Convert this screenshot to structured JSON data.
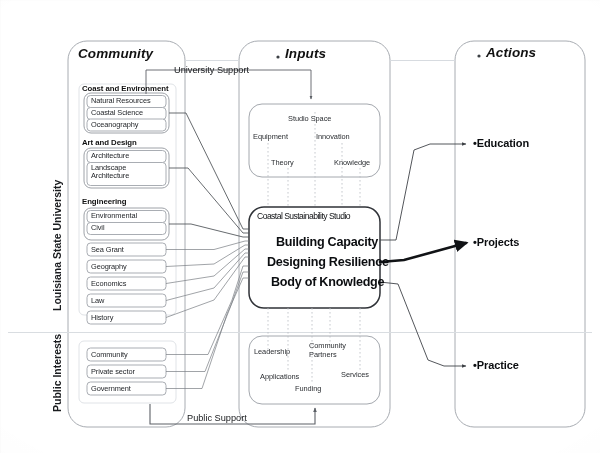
{
  "figure": {
    "columns": [
      {
        "id": "community",
        "label": "Community"
      },
      {
        "id": "inputs",
        "label": "Inputs"
      },
      {
        "id": "actions",
        "label": "Actions"
      }
    ],
    "side_labels": [
      {
        "id": "lsu",
        "label": "Louisiana State University"
      },
      {
        "id": "public",
        "label": "Public Interests"
      }
    ],
    "support_links": [
      {
        "id": "university-support",
        "label": "University Support"
      },
      {
        "id": "public-support",
        "label": "Public Support"
      }
    ]
  },
  "community": {
    "groups": [
      {
        "name": "Coast and Environment",
        "items": [
          "Natural Resources",
          "Coastal Science",
          "Oceanography"
        ]
      },
      {
        "name": "Art and Design",
        "items": [
          "Architecture",
          "Landscape Architecture"
        ]
      },
      {
        "name": "Engineering",
        "items": [
          "Environmental",
          "Civil"
        ]
      }
    ],
    "standalone": [
      "Sea Grant",
      "Geography",
      "Economics",
      "Law",
      "History"
    ],
    "public_interests": [
      "Community",
      "Private sector",
      "Government"
    ]
  },
  "inputs": {
    "upper_cluster": [
      "Studio Space",
      "Equipment",
      "Innovation",
      "Theory",
      "Knowledge"
    ],
    "core": {
      "title": "Coastal Sustainability Studio",
      "lines": [
        "Building Capacity",
        "Designing Resilience",
        "Body of Knowledge"
      ]
    },
    "lower_cluster": [
      "Leadership",
      "Community Partners",
      "Applications",
      "Funding",
      "Services"
    ]
  },
  "actions": {
    "items": [
      {
        "label": "Education",
        "emphasis": "normal"
      },
      {
        "label": "Projects",
        "emphasis": "strong"
      },
      {
        "label": "Practice",
        "emphasis": "normal"
      }
    ]
  },
  "colors": {
    "ink": "#15171a",
    "outline": "#8d9197",
    "faint": "#c2c6cb",
    "strong": "#1b1d20",
    "paper": "#ffffff"
  }
}
